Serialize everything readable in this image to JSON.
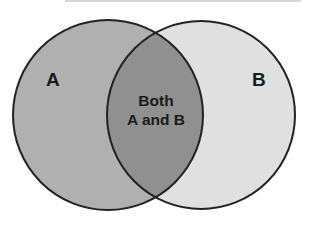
{
  "diagram": {
    "type": "venn",
    "sets": [
      {
        "id": "A",
        "label": "A",
        "fill": "#b0b0b0",
        "center": [
          108,
          115
        ],
        "radius": 95
      },
      {
        "id": "B",
        "label": "B",
        "fill": "#e0e0e0",
        "center": [
          201,
          115
        ],
        "radius": 94
      }
    ],
    "intersection": {
      "label_line1": "Both",
      "label_line2": "A and B",
      "fill": "#909090"
    },
    "stroke_color": "#222222"
  }
}
